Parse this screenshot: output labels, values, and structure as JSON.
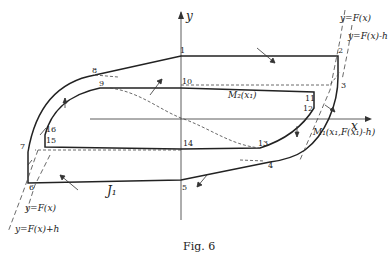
{
  "figure": {
    "caption": "Fig. 6",
    "axes": {
      "x_label": "x",
      "y_label": "y"
    },
    "curve_labels": {
      "F": "y=F(x)",
      "F_minus_h": "y=F(x)-h",
      "F_bottom": "y=F(x)",
      "F_plus_h": "y=F(x)+h"
    },
    "point_labels": {
      "p1": "1",
      "p2": "2",
      "p3": "3",
      "p4": "4",
      "p5": "5",
      "p6": "6",
      "p7": "7",
      "p8": "8",
      "p9": "9",
      "p10": "10",
      "p11": "11",
      "p12": "12",
      "p13": "13",
      "p14": "14",
      "p15": "15",
      "p16": "16"
    },
    "annotations": {
      "M2": "M₂(x₁)",
      "M1": "M₁(x₁,F(x₁)-h)",
      "J1": "J₁"
    }
  }
}
